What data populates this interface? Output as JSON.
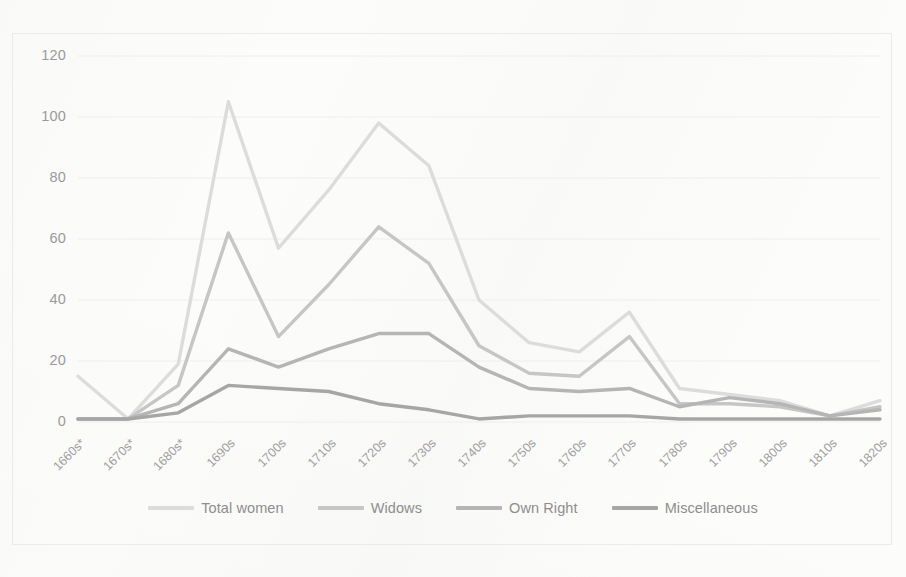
{
  "chart_data": {
    "type": "line",
    "title": "",
    "subtitle": "",
    "xlabel": "",
    "ylabel": "",
    "ylim": [
      0,
      120
    ],
    "yticks": [
      0,
      20,
      40,
      60,
      80,
      100,
      120
    ],
    "grid": true,
    "legend_position": "bottom",
    "categories": [
      "1660s*",
      "1670s*",
      "1680s*",
      "1690s",
      "1700s",
      "1710s",
      "1720s",
      "1730s",
      "1740s",
      "1750s",
      "1760s",
      "1770s",
      "1780s",
      "1790s",
      "1800s",
      "1810s",
      "1820s"
    ],
    "series": [
      {
        "name": "Total women",
        "color": "#dcdcdc",
        "values": [
          15,
          1,
          19,
          105,
          57,
          76,
          98,
          84,
          40,
          26,
          23,
          36,
          11,
          9,
          7,
          2,
          7
        ]
      },
      {
        "name": "Widows",
        "color": "#c6c6c6",
        "values": [
          1,
          1,
          12,
          62,
          28,
          45,
          64,
          52,
          25,
          16,
          15,
          28,
          6,
          6,
          5,
          2,
          5
        ]
      },
      {
        "name": "Own Right",
        "color": "#b5b5b5",
        "values": [
          1,
          1,
          6,
          24,
          18,
          24,
          29,
          29,
          18,
          11,
          10,
          11,
          5,
          8,
          6,
          2,
          4
        ]
      },
      {
        "name": "Miscellaneous",
        "color": "#a6a6a6",
        "values": [
          1,
          1,
          3,
          12,
          11,
          10,
          6,
          4,
          1,
          2,
          2,
          2,
          1,
          1,
          1,
          1,
          1
        ]
      }
    ]
  },
  "axis": {
    "y_tick_labels": [
      "120",
      "100",
      "80",
      "60",
      "40",
      "20",
      "0"
    ],
    "x_tick_labels": [
      "1660s*",
      "1670s*",
      "1680s*",
      "1690s",
      "1700s",
      "1710s",
      "1720s",
      "1730s",
      "1740s",
      "1750s",
      "1760s",
      "1770s",
      "1780s",
      "1790s",
      "1800s",
      "1810s",
      "1820s"
    ]
  },
  "legend": {
    "items": [
      {
        "label": "Total women",
        "color": "#dcdcdc"
      },
      {
        "label": "Widows",
        "color": "#c6c6c6"
      },
      {
        "label": "Own Right",
        "color": "#b5b5b5"
      },
      {
        "label": "Miscellaneous",
        "color": "#a6a6a6"
      }
    ]
  },
  "style": {
    "background": "#fcfcfb",
    "grid_color": "#f0eeee",
    "axis_text_color": "#9a9a9a",
    "frame_color": "#eceaea"
  }
}
